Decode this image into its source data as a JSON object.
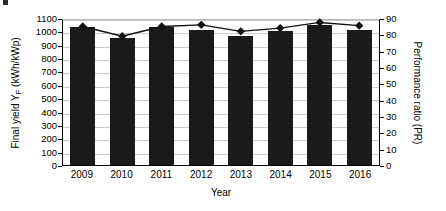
{
  "chart_data": {
    "type": "bar",
    "title": "",
    "xlabel": "Year",
    "ylabel": "Final yield Y_F (kWh/kWp)",
    "ylabel_secondary": "Performance ratio (PR)",
    "categories": [
      "2009",
      "2010",
      "2011",
      "2012",
      "2013",
      "2014",
      "2015",
      "2016"
    ],
    "ylim": [
      0,
      1100
    ],
    "ylim_secondary": [
      0,
      90
    ],
    "yticks": [
      0,
      100,
      200,
      300,
      400,
      500,
      600,
      700,
      800,
      900,
      1000,
      1100
    ],
    "yticks_secondary": [
      0,
      10,
      20,
      30,
      40,
      50,
      60,
      70,
      80,
      90
    ],
    "grid": true,
    "legend": "none",
    "series": [
      {
        "name": "Final yield Y_F (kWh/kWp)",
        "type": "bar",
        "axis": "left",
        "color": "#1a1a1a",
        "values": [
          1030,
          950,
          1035,
          1010,
          965,
          1000,
          1045,
          1010
        ]
      },
      {
        "name": "Performance ratio (PR)",
        "type": "line",
        "axis": "right",
        "color": "#111111",
        "marker": "diamond",
        "values": [
          86.0,
          80.0,
          86.0,
          87.0,
          83.0,
          85.0,
          88.5,
          86.5
        ]
      }
    ]
  },
  "axes": {
    "left": {
      "title_prefix": "Final yield Y",
      "title_sub": "F",
      "title_suffix": " (kWh/kWp)",
      "ticks": [
        "1100",
        "1000",
        "900",
        "800",
        "700",
        "600",
        "500",
        "400",
        "300",
        "200",
        "100",
        "0"
      ]
    },
    "right": {
      "title": "Performance ratio (PR)",
      "ticks": [
        "90",
        "80",
        "70",
        "60",
        "50",
        "40",
        "30",
        "20",
        "10",
        "0"
      ]
    },
    "bottom": {
      "title": "Year",
      "ticks": [
        "2009",
        "2010",
        "2011",
        "2012",
        "2013",
        "2014",
        "2015",
        "2016"
      ]
    }
  },
  "colors": {
    "bar": "#1a1a1a",
    "line": "#111111",
    "grid": "#c9c9c9",
    "axis": "#000000",
    "background": "#ffffff"
  }
}
